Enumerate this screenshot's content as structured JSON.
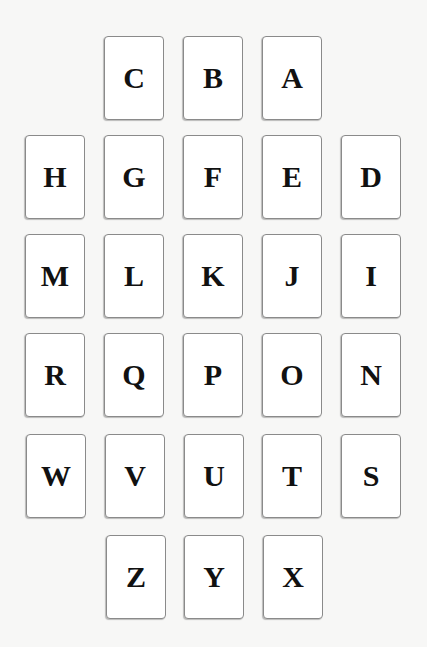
{
  "board": {
    "rows": [
      {
        "y": 36,
        "cards": [
          {
            "letter": "C",
            "x": 104
          },
          {
            "letter": "B",
            "x": 183
          },
          {
            "letter": "A",
            "x": 262
          }
        ]
      },
      {
        "y": 135,
        "cards": [
          {
            "letter": "H",
            "x": 25
          },
          {
            "letter": "G",
            "x": 104
          },
          {
            "letter": "F",
            "x": 183
          },
          {
            "letter": "E",
            "x": 262
          },
          {
            "letter": "D",
            "x": 341
          }
        ]
      },
      {
        "y": 234,
        "cards": [
          {
            "letter": "M",
            "x": 25
          },
          {
            "letter": "L",
            "x": 104
          },
          {
            "letter": "K",
            "x": 183
          },
          {
            "letter": "J",
            "x": 262
          },
          {
            "letter": "I",
            "x": 341
          }
        ]
      },
      {
        "y": 333,
        "cards": [
          {
            "letter": "R",
            "x": 25
          },
          {
            "letter": "Q",
            "x": 104
          },
          {
            "letter": "P",
            "x": 183
          },
          {
            "letter": "O",
            "x": 262
          },
          {
            "letter": "N",
            "x": 341
          }
        ]
      },
      {
        "y": 434,
        "cards": [
          {
            "letter": "W",
            "x": 26
          },
          {
            "letter": "V",
            "x": 105
          },
          {
            "letter": "U",
            "x": 184
          },
          {
            "letter": "T",
            "x": 262
          },
          {
            "letter": "S",
            "x": 341
          }
        ]
      },
      {
        "y": 535,
        "cards": [
          {
            "letter": "Z",
            "x": 106
          },
          {
            "letter": "Y",
            "x": 184
          },
          {
            "letter": "X",
            "x": 263
          }
        ]
      }
    ]
  },
  "colors": {
    "background": "#f7f7f6",
    "card_face": "#ffffff",
    "card_border": "#8a8a8a",
    "letter": "#111111"
  }
}
